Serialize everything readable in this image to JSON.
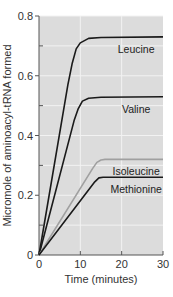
{
  "chart_data": {
    "type": "line",
    "title": "",
    "xlabel": "Time (minutes)",
    "ylabel": "Micromole of aminoacyl-tRNA formed",
    "xlim": [
      0,
      30
    ],
    "ylim": [
      0,
      0.8
    ],
    "xticks": [
      0,
      10,
      20,
      30
    ],
    "xtick_labels": [
      "0",
      "10",
      "20",
      "30"
    ],
    "yticks": [
      0,
      0.2,
      0.4,
      0.6,
      0.8
    ],
    "ytick_labels": [
      "0",
      "0.2",
      "0.4",
      "0.6",
      "0.8"
    ],
    "grid": true,
    "background_color": "#dcdcdc",
    "series": [
      {
        "name": "Leucine",
        "color": "#1a1a1a",
        "x": [
          0,
          7,
          8,
          9,
          10,
          12,
          15,
          30
        ],
        "y": [
          0,
          0.57,
          0.64,
          0.69,
          0.71,
          0.725,
          0.728,
          0.73
        ]
      },
      {
        "name": "Valine",
        "color": "#1a1a1a",
        "x": [
          0,
          8.5,
          9.5,
          10.5,
          12,
          15,
          30
        ],
        "y": [
          0,
          0.45,
          0.49,
          0.515,
          0.525,
          0.528,
          0.53
        ]
      },
      {
        "name": "Isoleucine",
        "color": "#a0a0a0",
        "x": [
          0,
          13,
          14,
          15,
          16,
          30
        ],
        "y": [
          0,
          0.29,
          0.31,
          0.318,
          0.32,
          0.32
        ]
      },
      {
        "name": "Methionine",
        "color": "#1a1a1a",
        "x": [
          0,
          13.5,
          14.5,
          15.5,
          30
        ],
        "y": [
          0,
          0.245,
          0.258,
          0.26,
          0.26
        ]
      }
    ]
  }
}
